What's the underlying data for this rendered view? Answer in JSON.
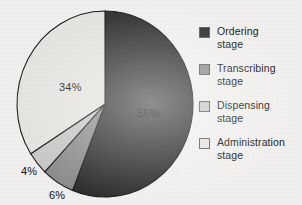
{
  "chart_data": {
    "type": "pie",
    "title": "",
    "subtitle": "",
    "xlabel": "",
    "ylabel": "",
    "grid": false,
    "legend_position": "right",
    "unit": "%",
    "categories": [
      "Ordering stage",
      "Transcribing stage",
      "Dispensing stage",
      "Administration stage"
    ],
    "values": [
      56,
      6,
      4,
      34
    ],
    "slices": [
      {
        "key": "ordering",
        "label_line1": "Ordering",
        "label_line2": "stage",
        "value": 56,
        "value_label": "56%",
        "color": "#2f2f2f",
        "start_deg": 0,
        "end_deg": 201.6
      },
      {
        "key": "transcribing",
        "label_line1": "Transcribing",
        "label_line2": "stage",
        "value": 6,
        "value_label": "6%",
        "color": "#8d8d8d",
        "start_deg": 201.6,
        "end_deg": 223.2
      },
      {
        "key": "dispensing",
        "label_line1": "Dispensing",
        "label_line2": "stage",
        "value": 4,
        "value_label": "4%",
        "color": "#c9c9c7",
        "start_deg": 223.2,
        "end_deg": 237.6
      },
      {
        "key": "administration",
        "label_line1": "Administration",
        "label_line2": "stage",
        "value": 34,
        "value_label": "34%",
        "color": "#e6e5e1",
        "start_deg": 237.6,
        "end_deg": 360
      }
    ],
    "labels": {
      "ordering": "56%",
      "transcribing": "6%",
      "dispensing": "4%",
      "administration": "34%"
    }
  },
  "legend": {
    "items": [
      {
        "label_line1": "Ordering",
        "label_line2": "stage",
        "color": "#2f2f2f"
      },
      {
        "label_line1": "Transcribing",
        "label_line2": "stage",
        "color": "#8d8d8d"
      },
      {
        "label_line1": "Dispensing",
        "label_line2": "stage",
        "color": "#c9c9c7"
      },
      {
        "label_line1": "Administration",
        "label_line2": "stage",
        "color": "#e6e5e1"
      }
    ]
  }
}
